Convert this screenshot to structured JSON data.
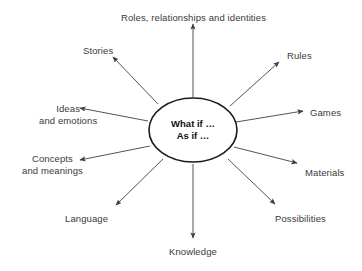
{
  "diagram": {
    "background_color": "#ffffff",
    "line_color": "#555555",
    "ellipse_stroke_color": "#1a1a1a",
    "label_text_color": "#3a3a3a",
    "center_text_color": "#111111",
    "center": {
      "lines": [
        "What if …",
        "As if …"
      ],
      "shape": "ellipse",
      "cx": 193,
      "cy": 130,
      "rx": 44,
      "ry": 32
    },
    "nodes": [
      {
        "id": "roles",
        "lines": [
          "Roles, relationships and identities"
        ],
        "label_x": 193,
        "label_y": 12,
        "align": "center",
        "arrow": {
          "x1": 193,
          "y1": 97,
          "x2": 193,
          "y2": 24
        }
      },
      {
        "id": "stories",
        "lines": [
          "Stories"
        ],
        "label_x": 98,
        "label_y": 45,
        "align": "center",
        "arrow": {
          "x1": 158,
          "y1": 104,
          "x2": 113,
          "y2": 57
        }
      },
      {
        "id": "ideas-and-emotions",
        "lines": [
          "Ideas",
          "and emotions"
        ],
        "label_x": 68,
        "label_y": 103,
        "align": "center",
        "arrow": {
          "x1": 148,
          "y1": 121,
          "x2": 80,
          "y2": 108
        }
      },
      {
        "id": "concepts-and-meanings",
        "lines": [
          "Concepts",
          "and meanings"
        ],
        "label_x": 52,
        "label_y": 153,
        "align": "center",
        "arrow": {
          "x1": 150,
          "y1": 146,
          "x2": 80,
          "y2": 160
        }
      },
      {
        "id": "language",
        "lines": [
          "Language"
        ],
        "label_x": 86,
        "label_y": 213,
        "align": "center",
        "arrow": {
          "x1": 163,
          "y1": 159,
          "x2": 116,
          "y2": 205
        }
      },
      {
        "id": "knowledge",
        "lines": [
          "Knowledge"
        ],
        "label_x": 193,
        "label_y": 246,
        "align": "center",
        "arrow": {
          "x1": 193,
          "y1": 164,
          "x2": 193,
          "y2": 238
        }
      },
      {
        "id": "possibilities",
        "lines": [
          "Possibilities"
        ],
        "label_x": 300,
        "label_y": 213,
        "align": "center",
        "arrow": {
          "x1": 228,
          "y1": 159,
          "x2": 275,
          "y2": 204
        }
      },
      {
        "id": "materials",
        "lines": [
          "Materials"
        ],
        "label_x": 324,
        "label_y": 167,
        "align": "center",
        "arrow": {
          "x1": 234,
          "y1": 147,
          "x2": 297,
          "y2": 163
        }
      },
      {
        "id": "games",
        "lines": [
          "Games"
        ],
        "label_x": 325,
        "label_y": 107,
        "align": "center",
        "arrow": {
          "x1": 236,
          "y1": 122,
          "x2": 303,
          "y2": 111
        }
      },
      {
        "id": "rules",
        "lines": [
          "Rules"
        ],
        "label_x": 299,
        "label_y": 50,
        "align": "center",
        "arrow": {
          "x1": 230,
          "y1": 106,
          "x2": 279,
          "y2": 62
        }
      }
    ]
  }
}
